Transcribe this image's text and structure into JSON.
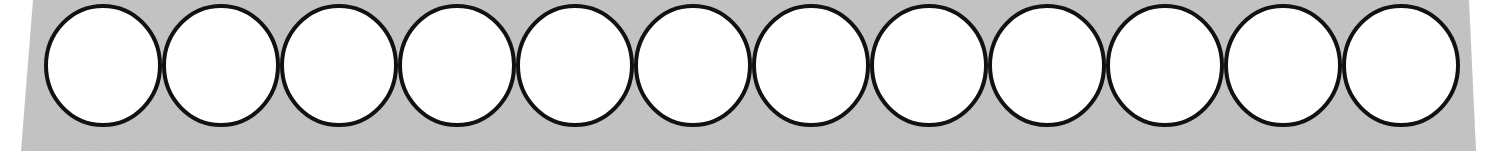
{
  "diagram": {
    "type": "circle-strip",
    "circle_count": 12,
    "circles": [
      {
        "index": 1,
        "filled": false
      },
      {
        "index": 2,
        "filled": false
      },
      {
        "index": 3,
        "filled": false
      },
      {
        "index": 4,
        "filled": false
      },
      {
        "index": 5,
        "filled": false
      },
      {
        "index": 6,
        "filled": false
      },
      {
        "index": 7,
        "filled": false
      },
      {
        "index": 8,
        "filled": false
      },
      {
        "index": 9,
        "filled": false
      },
      {
        "index": 10,
        "filled": false
      },
      {
        "index": 11,
        "filled": false
      },
      {
        "index": 12,
        "filled": false
      }
    ],
    "colors": {
      "background_strip": "#c3c3c3",
      "circle_fill": "#ffffff",
      "circle_stroke": "#111111",
      "page": "#ffffff"
    }
  }
}
